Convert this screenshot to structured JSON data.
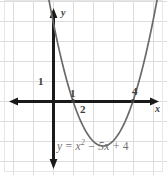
{
  "figure": {
    "kind": "coordinate-plane-parabola",
    "width": 167,
    "height": 175,
    "background_color": "#ffffff",
    "grid_color": "#dcdcdc",
    "axis_color": "#1a1a1a",
    "curve_color": "#6a6a6a",
    "label_color": "#3d3d3d",
    "equation_color": "#6f6f6f"
  },
  "labels": {
    "axis_x": "x",
    "axis_y": "y",
    "y_unit_tick": "1",
    "x_root_one": "1",
    "x_tick_two": "2",
    "x_root_four": "4",
    "equation_y": "y",
    "equation_equals": "=",
    "equation_x": "x",
    "equation_exponent": "2",
    "equation_minus": "−",
    "equation_five_x": "5x",
    "equation_plus": "+",
    "equation_four": "4",
    "equation_full": "y = x² − 5x + 4"
  },
  "chart_data": {
    "type": "line",
    "title": "",
    "subtitle": "",
    "xlabel": "x",
    "ylabel": "y",
    "grid": true,
    "legend": "none",
    "equation": "y = x^2 - 5x + 4",
    "xlim": [
      -2.65,
      5.7
    ],
    "ylim": [
      -3.15,
      5.05
    ],
    "grid_step": 1,
    "origin_px": [
      53,
      101
    ],
    "unit_px": 20,
    "annotations": [
      {
        "text": "1",
        "role": "y-axis-unit-tick",
        "x": -0.6,
        "y": 1
      },
      {
        "text": "1",
        "role": "x-intercept-label",
        "x": 1,
        "y": 0.45
      },
      {
        "text": "2",
        "role": "x-axis-tick",
        "x": 1.55,
        "y": -0.45
      },
      {
        "text": "4",
        "role": "x-intercept-label",
        "x": 4.1,
        "y": 0.55
      },
      {
        "text": "y",
        "role": "y-axis-name",
        "x": 0.45,
        "y": 4.4
      },
      {
        "text": "x",
        "role": "x-axis-name",
        "x": 5.15,
        "y": -0.45
      },
      {
        "text": "y = x² − 5x + 4",
        "role": "equation-caption",
        "x": 0.3,
        "y": -2.05
      }
    ],
    "roots": [
      1,
      4
    ],
    "vertex": [
      2.5,
      -2.25
    ],
    "y_intercept": 4,
    "series": [
      {
        "name": "y = x^2 - 5x + 4",
        "color": "#6a6a6a",
        "x": [
          -0.6,
          -0.4,
          -0.2,
          0,
          0.25,
          0.5,
          0.75,
          1,
          1.25,
          1.5,
          1.75,
          2,
          2.25,
          2.5,
          2.75,
          3,
          3.25,
          3.5,
          3.75,
          4,
          4.25,
          4.5,
          4.75,
          5,
          5.2,
          5.45
        ],
        "y": [
          7.36,
          6.16,
          5.04,
          4,
          2.8125,
          1.75,
          0.8125,
          0,
          -0.6875,
          -1.25,
          -1.6875,
          -2,
          -2.1875,
          -2.25,
          -2.1875,
          -2,
          -1.6875,
          -1.25,
          -0.6875,
          0,
          0.8125,
          1.75,
          2.8125,
          4,
          5.04,
          6.3025
        ]
      }
    ]
  }
}
